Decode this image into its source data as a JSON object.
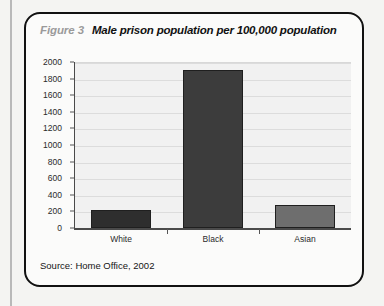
{
  "figure": {
    "number_label": "Figure 3",
    "title": "Male prison population per 100,000 population",
    "source": "Source: Home Office, 2002"
  },
  "chart_data": {
    "type": "bar",
    "title": "Male prison population per 100,000 population",
    "xlabel": "",
    "ylabel": "",
    "categories": [
      "White",
      "Black",
      "Asian"
    ],
    "values": [
      215,
      1900,
      280
    ],
    "ylim": [
      0,
      2000
    ],
    "y_ticks": [
      0,
      200,
      400,
      600,
      800,
      1000,
      1200,
      1400,
      1600,
      1800,
      2000
    ],
    "y_tick_labels": [
      "0",
      "200",
      "400",
      "600",
      "800",
      "1000",
      "1200",
      "1400",
      "1600",
      "1800",
      "2000"
    ],
    "grid": true,
    "legend": false,
    "bar_colors": [
      "#2e2e2e",
      "#3c3c3c",
      "#6e6e6e"
    ],
    "plot_background": "#f1f1f1",
    "gridline_color": "#dcdcdc",
    "axis_color": "#4a4a4a"
  }
}
